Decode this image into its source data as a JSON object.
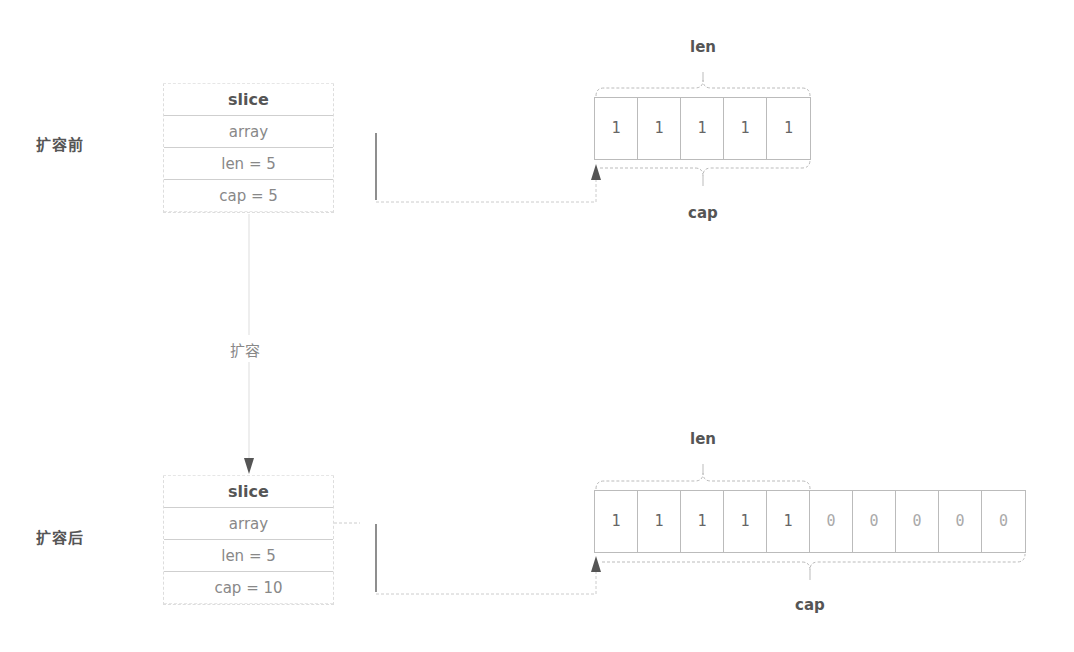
{
  "before": {
    "stage_label": "扩容前",
    "slice": {
      "header": "slice",
      "rows": [
        "array",
        "len = 5",
        "cap = 5"
      ]
    },
    "array": {
      "cells": [
        "1",
        "1",
        "1",
        "1",
        "1"
      ],
      "len_label": "len",
      "cap_label": "cap"
    }
  },
  "transition": {
    "label": "扩容"
  },
  "after": {
    "stage_label": "扩容后",
    "slice": {
      "header": "slice",
      "rows": [
        "array",
        "len = 5",
        "cap = 10"
      ]
    },
    "array": {
      "cells": [
        "1",
        "1",
        "1",
        "1",
        "1",
        "0",
        "0",
        "0",
        "0",
        "0"
      ],
      "len_label": "len",
      "cap_label": "cap"
    }
  },
  "colors": {
    "line": "#bbbbbb",
    "arrow": "#555555",
    "text": "#555555",
    "muted_text": "#888888"
  }
}
